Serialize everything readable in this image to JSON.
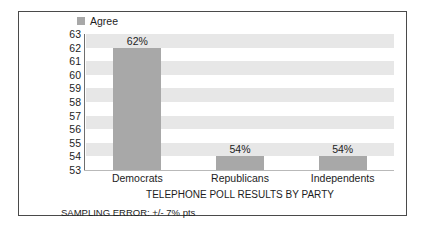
{
  "legend": {
    "swatch_name": "agree-swatch",
    "label": "Agree",
    "color": "#a8a8a8"
  },
  "footnote": "SAMPLING ERROR: +/- 7% pts",
  "chart_data": {
    "type": "bar",
    "title": "",
    "xlabel": "TELEPHONE POLL RESULTS BY PARTY",
    "ylabel": "",
    "categories": [
      "Democrats",
      "Republicans",
      "Independents"
    ],
    "values": [
      62,
      54,
      54
    ],
    "data_labels": [
      "62%",
      "54%",
      "54%"
    ],
    "series": [
      {
        "name": "Agree",
        "color": "#a8a8a8",
        "values": [
          62,
          54,
          54
        ]
      }
    ],
    "ylim": [
      53,
      63
    ],
    "ytick_step": 1,
    "ytick_labels": [
      "63",
      "62",
      "61",
      "60",
      "59",
      "58",
      "57",
      "56",
      "55",
      "54",
      "53"
    ],
    "grid": "horizontal-bands",
    "band_color": "#e7e7e7",
    "legend_position": "top-left",
    "annotations": [
      "SAMPLING ERROR: +/- 7% pts"
    ]
  }
}
